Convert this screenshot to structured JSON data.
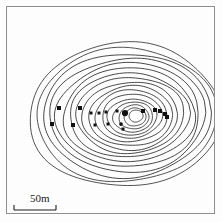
{
  "figure": {
    "type": "contour-map",
    "caption_text": "",
    "frame_color": "#8e8e8e",
    "line_color": "#1a1a1a",
    "background_color": "#ffffff"
  },
  "scale": {
    "label": "50m",
    "bar_length_px": 42,
    "units": "m",
    "value": 50
  },
  "chart_data": {
    "type": "contour",
    "title": "",
    "xlabel": "",
    "ylabel": "",
    "grid": false,
    "legend": "none",
    "center": {
      "x": 123,
      "y": 110
    },
    "n_contours": 17,
    "contours": [
      {
        "index": 1,
        "rx": 96,
        "ry": 72,
        "cx": 118,
        "cy": 108,
        "rot": -2
      },
      {
        "index": 2,
        "rx": 90,
        "ry": 67,
        "cx": 119,
        "cy": 108,
        "rot": -2
      },
      {
        "index": 3,
        "rx": 84,
        "ry": 62,
        "cx": 120,
        "cy": 108,
        "rot": -2
      },
      {
        "index": 4,
        "rx": 78,
        "ry": 57,
        "cx": 121,
        "cy": 108,
        "rot": -2
      },
      {
        "index": 5,
        "rx": 72,
        "ry": 52,
        "cx": 121,
        "cy": 108,
        "rot": -2
      },
      {
        "index": 6,
        "rx": 66,
        "ry": 47,
        "cx": 122,
        "cy": 108,
        "rot": -2
      },
      {
        "index": 7,
        "rx": 60,
        "ry": 42,
        "cx": 122,
        "cy": 108,
        "rot": -2
      },
      {
        "index": 8,
        "rx": 54,
        "ry": 38,
        "cx": 123,
        "cy": 108,
        "rot": -2
      },
      {
        "index": 9,
        "rx": 48,
        "ry": 34,
        "cx": 123,
        "cy": 109,
        "rot": -3
      },
      {
        "index": 10,
        "rx": 42,
        "ry": 30,
        "cx": 124,
        "cy": 109,
        "rot": -3
      },
      {
        "index": 11,
        "rx": 36,
        "ry": 26,
        "cx": 124,
        "cy": 109,
        "rot": -3
      },
      {
        "index": 12,
        "rx": 30,
        "ry": 22,
        "cx": 125,
        "cy": 109,
        "rot": -4
      },
      {
        "index": 13,
        "rx": 25,
        "ry": 18,
        "cx": 125,
        "cy": 110,
        "rot": -4
      },
      {
        "index": 14,
        "rx": 20,
        "ry": 15,
        "cx": 126,
        "cy": 110,
        "rot": -5
      },
      {
        "index": 15,
        "rx": 15,
        "ry": 12,
        "cx": 127,
        "cy": 110,
        "rot": -6
      },
      {
        "index": 16,
        "rx": 11,
        "ry": 9,
        "cx": 128,
        "cy": 110,
        "rot": -6
      },
      {
        "index": 17,
        "rx": 7,
        "ry": 6,
        "cx": 129,
        "cy": 109,
        "rot": -6
      }
    ],
    "markers": [
      {
        "x": 52,
        "y": 101,
        "shape": "square",
        "size": 4
      },
      {
        "x": 45,
        "y": 117,
        "shape": "square",
        "size": 4
      },
      {
        "x": 66,
        "y": 118,
        "shape": "square",
        "size": 4
      },
      {
        "x": 73,
        "y": 101,
        "shape": "square",
        "size": 4
      },
      {
        "x": 84,
        "y": 106,
        "shape": "square",
        "size": 3
      },
      {
        "x": 92,
        "y": 106,
        "shape": "square",
        "size": 3
      },
      {
        "x": 99,
        "y": 105,
        "shape": "square",
        "size": 3
      },
      {
        "x": 88,
        "y": 118,
        "shape": "square",
        "size": 3
      },
      {
        "x": 101,
        "y": 117,
        "shape": "square",
        "size": 3
      },
      {
        "x": 110,
        "y": 104,
        "shape": "square",
        "size": 3
      },
      {
        "x": 118,
        "y": 106,
        "shape": "circle",
        "size": 5
      },
      {
        "x": 114,
        "y": 117,
        "shape": "circle",
        "size": 3
      },
      {
        "x": 116,
        "y": 122,
        "shape": "square",
        "size": 3
      },
      {
        "x": 136,
        "y": 104,
        "shape": "square",
        "size": 4
      },
      {
        "x": 148,
        "y": 103,
        "shape": "square",
        "size": 4
      },
      {
        "x": 153,
        "y": 104,
        "shape": "square",
        "size": 4
      },
      {
        "x": 158,
        "y": 107,
        "shape": "square",
        "size": 4
      },
      {
        "x": 160,
        "y": 110,
        "shape": "square",
        "size": 4
      }
    ]
  }
}
